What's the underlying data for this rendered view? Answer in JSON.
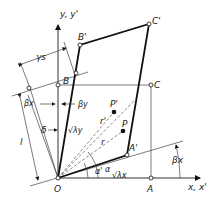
{
  "diagram": {
    "colors": {
      "line": "#111111",
      "background": "#ffffff"
    },
    "axes": {
      "x_label": "x, x'",
      "y_label": "y, y'"
    },
    "points": {
      "O": "O",
      "A": "A",
      "B": "B",
      "C": "C",
      "A_prime": "A'",
      "B_prime": "B'",
      "C_prime": "C'",
      "P": "P",
      "P_prime": "P'"
    },
    "labels": {
      "gamma_s": "γs",
      "beta_x": "βx",
      "beta_y": "βy",
      "beta_x_right": "βx",
      "delta": "δ",
      "l": "l",
      "sqrt_lambda_y": "√λy",
      "sqrt_lambda_x": "√λx",
      "r": "r",
      "r_prime": "r'",
      "alpha": "α",
      "alpha_prime": "α'"
    }
  }
}
